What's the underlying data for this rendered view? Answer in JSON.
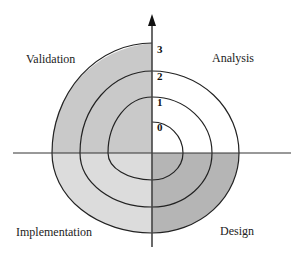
{
  "diagram": {
    "type": "spiral-model",
    "quadrants": [
      {
        "id": "validation",
        "label": "Validation",
        "position": "top-left",
        "fill": "#c9c9c9"
      },
      {
        "id": "analysis",
        "label": "Analysis",
        "position": "top-right",
        "fill": "#ffffff"
      },
      {
        "id": "implementation",
        "label": "Implementation",
        "position": "bottom-left",
        "fill": "#dcdcdc"
      },
      {
        "id": "design",
        "label": "Design",
        "position": "bottom-right",
        "fill": "#b5b5b5"
      }
    ],
    "cycle_labels": [
      "0",
      "1",
      "2",
      "3"
    ],
    "colors": {
      "line": "#222222",
      "axis": "#333333"
    }
  }
}
